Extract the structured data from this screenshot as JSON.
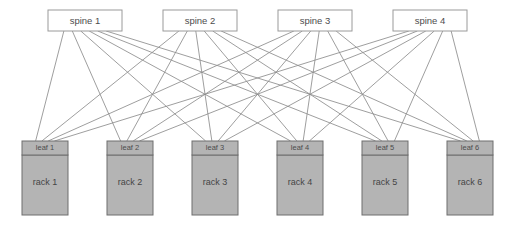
{
  "diagram": {
    "type": "network-topology",
    "width": 511,
    "height": 225,
    "background_color": "#ffffff"
  },
  "style": {
    "spine_fill": "#ffffff",
    "spine_stroke": "#9a9a9a",
    "node_fill": "#b4b4b4",
    "node_stroke": "#6e6e6e",
    "link_stroke": "#8c8c8c",
    "text_color": "#4d4d4d"
  },
  "spines": [
    {
      "id": "spine-1",
      "label": "spine 1",
      "x": 48,
      "y": 10,
      "w": 74,
      "h": 21
    },
    {
      "id": "spine-2",
      "label": "spine 2",
      "x": 163,
      "y": 10,
      "w": 74,
      "h": 21
    },
    {
      "id": "spine-3",
      "label": "spine 3",
      "x": 278,
      "y": 10,
      "w": 74,
      "h": 21
    },
    {
      "id": "spine-4",
      "label": "spine 4",
      "x": 393,
      "y": 10,
      "w": 74,
      "h": 21
    }
  ],
  "leaves": [
    {
      "id": "leaf-1",
      "label": "leaf 1",
      "x": 22,
      "y": 141,
      "w": 46,
      "h": 14
    },
    {
      "id": "leaf-2",
      "label": "leaf 2",
      "x": 107,
      "y": 141,
      "w": 46,
      "h": 14
    },
    {
      "id": "leaf-3",
      "label": "leaf 3",
      "x": 192,
      "y": 141,
      "w": 46,
      "h": 14
    },
    {
      "id": "leaf-4",
      "label": "leaf 4",
      "x": 277,
      "y": 141,
      "w": 46,
      "h": 14
    },
    {
      "id": "leaf-5",
      "label": "leaf 5",
      "x": 362,
      "y": 141,
      "w": 46,
      "h": 14
    },
    {
      "id": "leaf-6",
      "label": "leaf 6",
      "x": 447,
      "y": 141,
      "w": 46,
      "h": 14
    }
  ],
  "racks": [
    {
      "id": "rack-1",
      "label": "rack 1",
      "x": 22,
      "y": 155,
      "w": 46,
      "h": 60
    },
    {
      "id": "rack-2",
      "label": "rack 2",
      "x": 107,
      "y": 155,
      "w": 46,
      "h": 60
    },
    {
      "id": "rack-3",
      "label": "rack 3",
      "x": 192,
      "y": 155,
      "w": 46,
      "h": 60
    },
    {
      "id": "rack-4",
      "label": "rack 4",
      "x": 277,
      "y": 155,
      "w": 46,
      "h": 60
    },
    {
      "id": "rack-5",
      "label": "rack 5",
      "x": 362,
      "y": 155,
      "w": 46,
      "h": 60
    },
    {
      "id": "rack-6",
      "label": "rack 6",
      "x": 447,
      "y": 155,
      "w": 46,
      "h": 60
    }
  ],
  "links": {
    "description": "full mesh: every spine connects to every leaf",
    "count": 24,
    "pairs": [
      [
        "spine-1",
        "leaf-1"
      ],
      [
        "spine-1",
        "leaf-2"
      ],
      [
        "spine-1",
        "leaf-3"
      ],
      [
        "spine-1",
        "leaf-4"
      ],
      [
        "spine-1",
        "leaf-5"
      ],
      [
        "spine-1",
        "leaf-6"
      ],
      [
        "spine-2",
        "leaf-1"
      ],
      [
        "spine-2",
        "leaf-2"
      ],
      [
        "spine-2",
        "leaf-3"
      ],
      [
        "spine-2",
        "leaf-4"
      ],
      [
        "spine-2",
        "leaf-5"
      ],
      [
        "spine-2",
        "leaf-6"
      ],
      [
        "spine-3",
        "leaf-1"
      ],
      [
        "spine-3",
        "leaf-2"
      ],
      [
        "spine-3",
        "leaf-3"
      ],
      [
        "spine-3",
        "leaf-4"
      ],
      [
        "spine-3",
        "leaf-5"
      ],
      [
        "spine-3",
        "leaf-6"
      ],
      [
        "spine-4",
        "leaf-1"
      ],
      [
        "spine-4",
        "leaf-2"
      ],
      [
        "spine-4",
        "leaf-3"
      ],
      [
        "spine-4",
        "leaf-4"
      ],
      [
        "spine-4",
        "leaf-5"
      ],
      [
        "spine-4",
        "leaf-6"
      ]
    ]
  }
}
